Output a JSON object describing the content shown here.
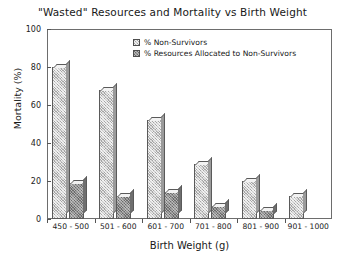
{
  "chart_data": {
    "type": "bar",
    "title": "\"Wasted\" Resources and Mortality vs Birth Weight",
    "xlabel": "Birth Weight (g)",
    "ylabel": "Mortality (%)",
    "categories": [
      "450 - 500",
      "501 - 600",
      "601 - 700",
      "701 - 800",
      "801 - 900",
      "901 - 1000"
    ],
    "series": [
      {
        "name": "% Non-Survivors",
        "values": [
          80,
          68,
          52,
          29,
          20,
          12
        ]
      },
      {
        "name": "% Resources Allocated to Non-Survivors",
        "values": [
          19,
          12,
          14,
          7,
          5,
          0
        ]
      }
    ],
    "ylim": [
      0,
      100
    ],
    "yticks": [
      "0",
      "20",
      "40",
      "60",
      "80",
      "100"
    ],
    "grid": false,
    "legend_position": "top-center"
  },
  "legend": {
    "entries": [
      {
        "label": "% Non-Survivors",
        "swatch": "light-hatched-swatch"
      },
      {
        "label": "% Resources Allocated to Non-Survivors",
        "swatch": "dark-hatched-swatch"
      }
    ]
  }
}
